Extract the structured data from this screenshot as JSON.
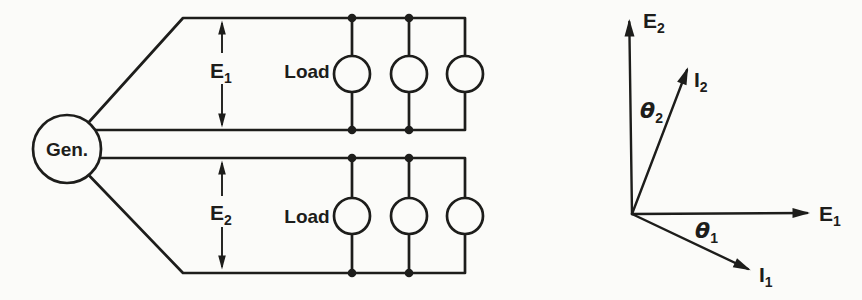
{
  "colors": {
    "ink": "#1d1d1b",
    "paper": "#fbfbf9"
  },
  "circuit": {
    "generator": {
      "label": "Gen."
    },
    "top_feeder": {
      "voltage": {
        "main": "E",
        "sub": "1"
      },
      "load_label": "Load",
      "load_count": "3"
    },
    "bottom_feeder": {
      "voltage": {
        "main": "E",
        "sub": "2"
      },
      "load_label": "Load",
      "load_count": "3"
    }
  },
  "phasor": {
    "E2": {
      "main": "E",
      "sub": "2"
    },
    "I2": {
      "main": "I",
      "sub": "2"
    },
    "theta2": {
      "main": "θ",
      "sub": "2"
    },
    "E1": {
      "main": "E",
      "sub": "1"
    },
    "theta1": {
      "main": "θ",
      "sub": "1"
    },
    "I1": {
      "main": "I",
      "sub": "1"
    }
  }
}
